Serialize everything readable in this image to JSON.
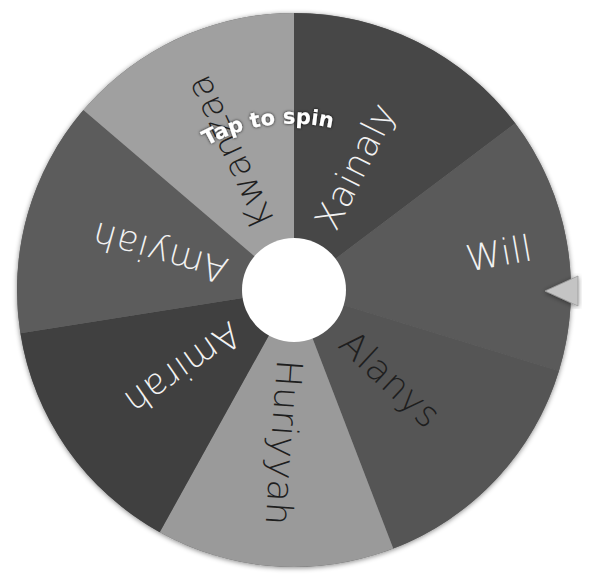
{
  "wheel": {
    "center": {
      "x": 294,
      "y": 290
    },
    "radius": 277,
    "hub_radius": 52,
    "hub_color": "#ffffff",
    "rim_color": "#6a6a6a",
    "segments": [
      {
        "label": "Xainaly",
        "start": -90,
        "end": -37,
        "color": "#474747",
        "text_color": "#f2f2f2"
      },
      {
        "label": "Will",
        "start": -37,
        "end": 17,
        "color": "#5a5a5a",
        "text_color": "#f2f2f2"
      },
      {
        "label": "Alanys",
        "start": 17,
        "end": 69,
        "color": "#555555",
        "text_color": "#1e1e1e"
      },
      {
        "label": "Huriyyah",
        "start": 69,
        "end": 119,
        "color": "#9a9a9a",
        "text_color": "#1e1e1e"
      },
      {
        "label": "Amirah",
        "start": 119,
        "end": 171,
        "color": "#3f3f3f",
        "text_color": "#f2f2f2"
      },
      {
        "label": "Amyiah",
        "start": 171,
        "end": 220.5,
        "color": "#5c5c5c",
        "text_color": "#f2f2f2"
      },
      {
        "label": "Kwanzaa",
        "start": 220.5,
        "end": 270,
        "color": "#a0a0a0",
        "text_color": "#1e1e1e"
      }
    ]
  },
  "spin_prompt": "Tap to spin",
  "pointer": {
    "color": "#c4c4c4",
    "tip_x": 545,
    "tip_y": 291
  }
}
